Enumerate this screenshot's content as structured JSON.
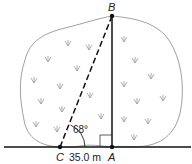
{
  "diagram": {
    "points": {
      "A": {
        "label": "A",
        "x": 112,
        "y": 147
      },
      "B": {
        "label": "B",
        "x": 112,
        "y": 16
      },
      "C": {
        "label": "C",
        "x": 60,
        "y": 147
      }
    },
    "angle_label": "68°",
    "distance_label": "35.0 m",
    "colors": {
      "line": "#111111",
      "bush_outline": "#888888",
      "grass": "#999999"
    }
  }
}
